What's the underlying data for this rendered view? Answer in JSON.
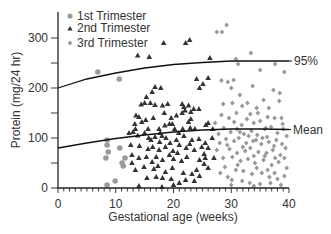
{
  "chart_data": {
    "type": "scatter",
    "title": "",
    "xlabel": "Gestational age (weeks)",
    "ylabel": "Protein (mg/24 hr)",
    "xlim": [
      0,
      40
    ],
    "ylim": [
      0,
      350
    ],
    "x_ticks": [
      0,
      10,
      20,
      30,
      40
    ],
    "y_ticks": [
      0,
      100,
      200,
      300
    ],
    "grid": false,
    "legend_position": "top-left",
    "series": [
      {
        "name": "1st Trimester",
        "marker": "circle",
        "color": "#9a9a9a",
        "points": [
          [
            6.9,
            232
          ],
          [
            10.6,
            218
          ],
          [
            8.5,
            96
          ],
          [
            8.5,
            86
          ],
          [
            8.7,
            72
          ],
          [
            8.3,
            60
          ],
          [
            10.7,
            80
          ],
          [
            11.6,
            60
          ],
          [
            11.1,
            50
          ],
          [
            11.3,
            44
          ],
          [
            8.5,
            6
          ],
          [
            9.9,
            14
          ]
        ]
      },
      {
        "name": "2nd Trimester",
        "marker": "triangle",
        "color": "#333333",
        "points": [
          [
            13.8,
            265
          ],
          [
            15.8,
            262
          ],
          [
            18.3,
            290
          ],
          [
            22.1,
            290
          ],
          [
            22.8,
            296
          ],
          [
            16.8,
            202
          ],
          [
            17.8,
            200
          ],
          [
            16.3,
            192
          ],
          [
            15.3,
            182
          ],
          [
            16.0,
            170
          ],
          [
            15.0,
            170
          ],
          [
            14.4,
            167
          ],
          [
            16.8,
            166
          ],
          [
            18.1,
            165
          ],
          [
            19.0,
            168
          ],
          [
            21.5,
            168
          ],
          [
            21.8,
            162
          ],
          [
            22.0,
            155
          ],
          [
            22.6,
            165
          ],
          [
            23.5,
            158
          ],
          [
            24.4,
            158
          ],
          [
            23.0,
            152
          ],
          [
            24.5,
            200
          ],
          [
            25.1,
            208
          ],
          [
            24.0,
            218
          ],
          [
            26.0,
            220
          ],
          [
            26.3,
            260
          ],
          [
            13.5,
            145
          ],
          [
            14.0,
            142
          ],
          [
            15.2,
            136
          ],
          [
            16.5,
            140
          ],
          [
            18.4,
            150
          ],
          [
            19.6,
            140
          ],
          [
            20.5,
            145
          ],
          [
            21.5,
            150
          ],
          [
            13.3,
            128
          ],
          [
            14.5,
            132
          ],
          [
            17.5,
            118
          ],
          [
            18.5,
            125
          ],
          [
            19.8,
            128
          ],
          [
            20.9,
            110
          ],
          [
            22.9,
            120
          ],
          [
            23.7,
            118
          ],
          [
            25.6,
            126
          ],
          [
            26.8,
            118
          ],
          [
            12.3,
            110
          ],
          [
            13.0,
            112
          ],
          [
            13.8,
            105
          ],
          [
            15.0,
            110
          ],
          [
            16.1,
            96
          ],
          [
            16.8,
            102
          ],
          [
            17.6,
            92
          ],
          [
            18.7,
            100
          ],
          [
            19.4,
            90
          ],
          [
            20.5,
            96
          ],
          [
            21.8,
            104
          ],
          [
            23.2,
            96
          ],
          [
            24.4,
            98
          ],
          [
            25.5,
            90
          ],
          [
            12.6,
            86
          ],
          [
            14.1,
            84
          ],
          [
            15.6,
            78
          ],
          [
            16.4,
            82
          ],
          [
            17.5,
            76
          ],
          [
            18.6,
            82
          ],
          [
            19.9,
            74
          ],
          [
            21.0,
            86
          ],
          [
            22.2,
            80
          ],
          [
            23.6,
            76
          ],
          [
            24.9,
            82
          ],
          [
            26.0,
            80
          ],
          [
            12.8,
            66
          ],
          [
            14.0,
            60
          ],
          [
            15.3,
            62
          ],
          [
            16.3,
            52
          ],
          [
            17.0,
            62
          ],
          [
            18.1,
            56
          ],
          [
            19.3,
            66
          ],
          [
            20.0,
            58
          ],
          [
            21.4,
            54
          ],
          [
            22.3,
            62
          ],
          [
            24.5,
            56
          ],
          [
            25.3,
            48
          ],
          [
            12.8,
            50
          ],
          [
            14.9,
            42
          ],
          [
            16.6,
            38
          ],
          [
            17.3,
            44
          ],
          [
            18.6,
            32
          ],
          [
            19.8,
            40
          ],
          [
            21.7,
            30
          ],
          [
            23.2,
            28
          ],
          [
            24.0,
            36
          ],
          [
            13.4,
            36
          ],
          [
            15.4,
            20
          ],
          [
            17.0,
            22
          ],
          [
            18.1,
            20
          ],
          [
            19.6,
            18
          ],
          [
            22.1,
            16
          ],
          [
            23.6,
            14
          ],
          [
            24.5,
            24
          ],
          [
            21.0,
            10
          ],
          [
            20.0,
            6
          ],
          [
            14.0,
            4
          ],
          [
            18.0,
            2
          ],
          [
            20.7,
            70
          ],
          [
            22.8,
            88
          ],
          [
            25.3,
            68
          ],
          [
            26.7,
            100
          ],
          [
            27.0,
            60
          ],
          [
            26.0,
            40
          ],
          [
            25.5,
            60
          ],
          [
            13.4,
            118
          ],
          [
            15.6,
            118
          ],
          [
            26.0,
            130
          ],
          [
            23.0,
            138
          ],
          [
            22.6,
            132
          ],
          [
            19.3,
            128
          ],
          [
            17.7,
            110
          ],
          [
            20.2,
            118
          ],
          [
            21.6,
            118
          ],
          [
            15.7,
            100
          ],
          [
            18.0,
            104
          ]
        ]
      },
      {
        "name": "3rd Trimester",
        "marker": "diamond",
        "color": "#999999",
        "points": [
          [
            27.5,
            312
          ],
          [
            28.4,
            312
          ],
          [
            29.2,
            326
          ],
          [
            30.8,
            258
          ],
          [
            31.2,
            248
          ],
          [
            33.4,
            270
          ],
          [
            35.0,
            236
          ],
          [
            37.6,
            248
          ],
          [
            39.2,
            232
          ],
          [
            30.0,
            200
          ],
          [
            28.3,
            215
          ],
          [
            29.4,
            212
          ],
          [
            30.4,
            216
          ],
          [
            31.5,
            186
          ],
          [
            33.7,
            204
          ],
          [
            35.6,
            176
          ],
          [
            37.3,
            196
          ],
          [
            38.4,
            190
          ],
          [
            28.6,
            168
          ],
          [
            30.2,
            170
          ],
          [
            31.9,
            164
          ],
          [
            33.3,
            148
          ],
          [
            34.6,
            150
          ],
          [
            36.5,
            160
          ],
          [
            38.3,
            174
          ],
          [
            28.3,
            146
          ],
          [
            29.6,
            140
          ],
          [
            30.5,
            132
          ],
          [
            31.8,
            126
          ],
          [
            32.7,
            138
          ],
          [
            33.9,
            130
          ],
          [
            35.0,
            134
          ],
          [
            36.3,
            142
          ],
          [
            37.5,
            140
          ],
          [
            38.9,
            128
          ],
          [
            28.7,
            120
          ],
          [
            29.9,
            112
          ],
          [
            31.0,
            118
          ],
          [
            32.2,
            108
          ],
          [
            33.5,
            114
          ],
          [
            34.5,
            106
          ],
          [
            35.8,
            118
          ],
          [
            36.9,
            122
          ],
          [
            38.0,
            110
          ],
          [
            39.0,
            118
          ],
          [
            29.1,
            98
          ],
          [
            30.5,
            94
          ],
          [
            31.3,
            100
          ],
          [
            32.6,
            90
          ],
          [
            33.8,
            94
          ],
          [
            35.2,
            88
          ],
          [
            36.5,
            92
          ],
          [
            37.8,
            96
          ],
          [
            28.0,
            90
          ],
          [
            29.7,
            78
          ],
          [
            31.0,
            70
          ],
          [
            32.4,
            74
          ],
          [
            33.3,
            80
          ],
          [
            34.7,
            72
          ],
          [
            36.1,
            70
          ],
          [
            37.2,
            76
          ],
          [
            38.5,
            66
          ],
          [
            39.4,
            80
          ],
          [
            28.6,
            60
          ],
          [
            30.2,
            62
          ],
          [
            31.6,
            54
          ],
          [
            32.9,
            58
          ],
          [
            34.1,
            50
          ],
          [
            35.6,
            56
          ],
          [
            37.0,
            46
          ],
          [
            38.2,
            52
          ],
          [
            39.6,
            40
          ],
          [
            28.9,
            42
          ],
          [
            30.8,
            36
          ],
          [
            32.1,
            34
          ],
          [
            33.6,
            28
          ],
          [
            35.3,
            30
          ],
          [
            36.6,
            22
          ],
          [
            38.0,
            18
          ],
          [
            39.2,
            24
          ],
          [
            29.4,
            22
          ],
          [
            31.9,
            14
          ],
          [
            33.2,
            10
          ],
          [
            35.0,
            8
          ],
          [
            36.8,
            10
          ],
          [
            38.6,
            6
          ],
          [
            30.0,
            6
          ],
          [
            27.2,
            130
          ],
          [
            27.8,
            108
          ],
          [
            27.5,
            76
          ],
          [
            28.1,
            30
          ],
          [
            34.4,
            160
          ],
          [
            36.0,
            120
          ],
          [
            35.4,
            100
          ],
          [
            38.7,
            140
          ],
          [
            39.6,
            104
          ],
          [
            32.8,
            170
          ],
          [
            30.9,
            150
          ],
          [
            31.5,
            112
          ],
          [
            33.0,
            104
          ],
          [
            34.3,
            96
          ],
          [
            36.2,
            102
          ],
          [
            37.4,
            84
          ],
          [
            38.8,
            88
          ],
          [
            29.3,
            86
          ],
          [
            32.0,
            82
          ],
          [
            33.9,
            64
          ],
          [
            35.8,
            64
          ],
          [
            37.6,
            60
          ],
          [
            39.2,
            60
          ],
          [
            31.1,
            46
          ],
          [
            34.4,
            40
          ],
          [
            36.3,
            36
          ],
          [
            30.1,
            16
          ],
          [
            33.9,
            4
          ],
          [
            37.5,
            30
          ]
        ]
      }
    ],
    "curves": [
      {
        "name": "95%",
        "label": "95%",
        "points": [
          [
            0,
            200
          ],
          [
            5,
            218
          ],
          [
            10,
            230
          ],
          [
            15,
            240
          ],
          [
            20,
            247
          ],
          [
            25,
            251
          ],
          [
            30,
            254
          ],
          [
            35,
            254
          ],
          [
            40,
            254
          ]
        ]
      },
      {
        "name": "Mean",
        "label": "Mean",
        "points": [
          [
            0,
            80
          ],
          [
            5,
            90
          ],
          [
            10,
            99
          ],
          [
            15,
            106
          ],
          [
            20,
            112
          ],
          [
            25,
            116
          ],
          [
            30,
            118
          ],
          [
            35,
            118
          ],
          [
            40,
            117
          ]
        ]
      }
    ],
    "legend": [
      "1st Trimester",
      "2nd Trimester",
      "3rd Trimester"
    ]
  }
}
